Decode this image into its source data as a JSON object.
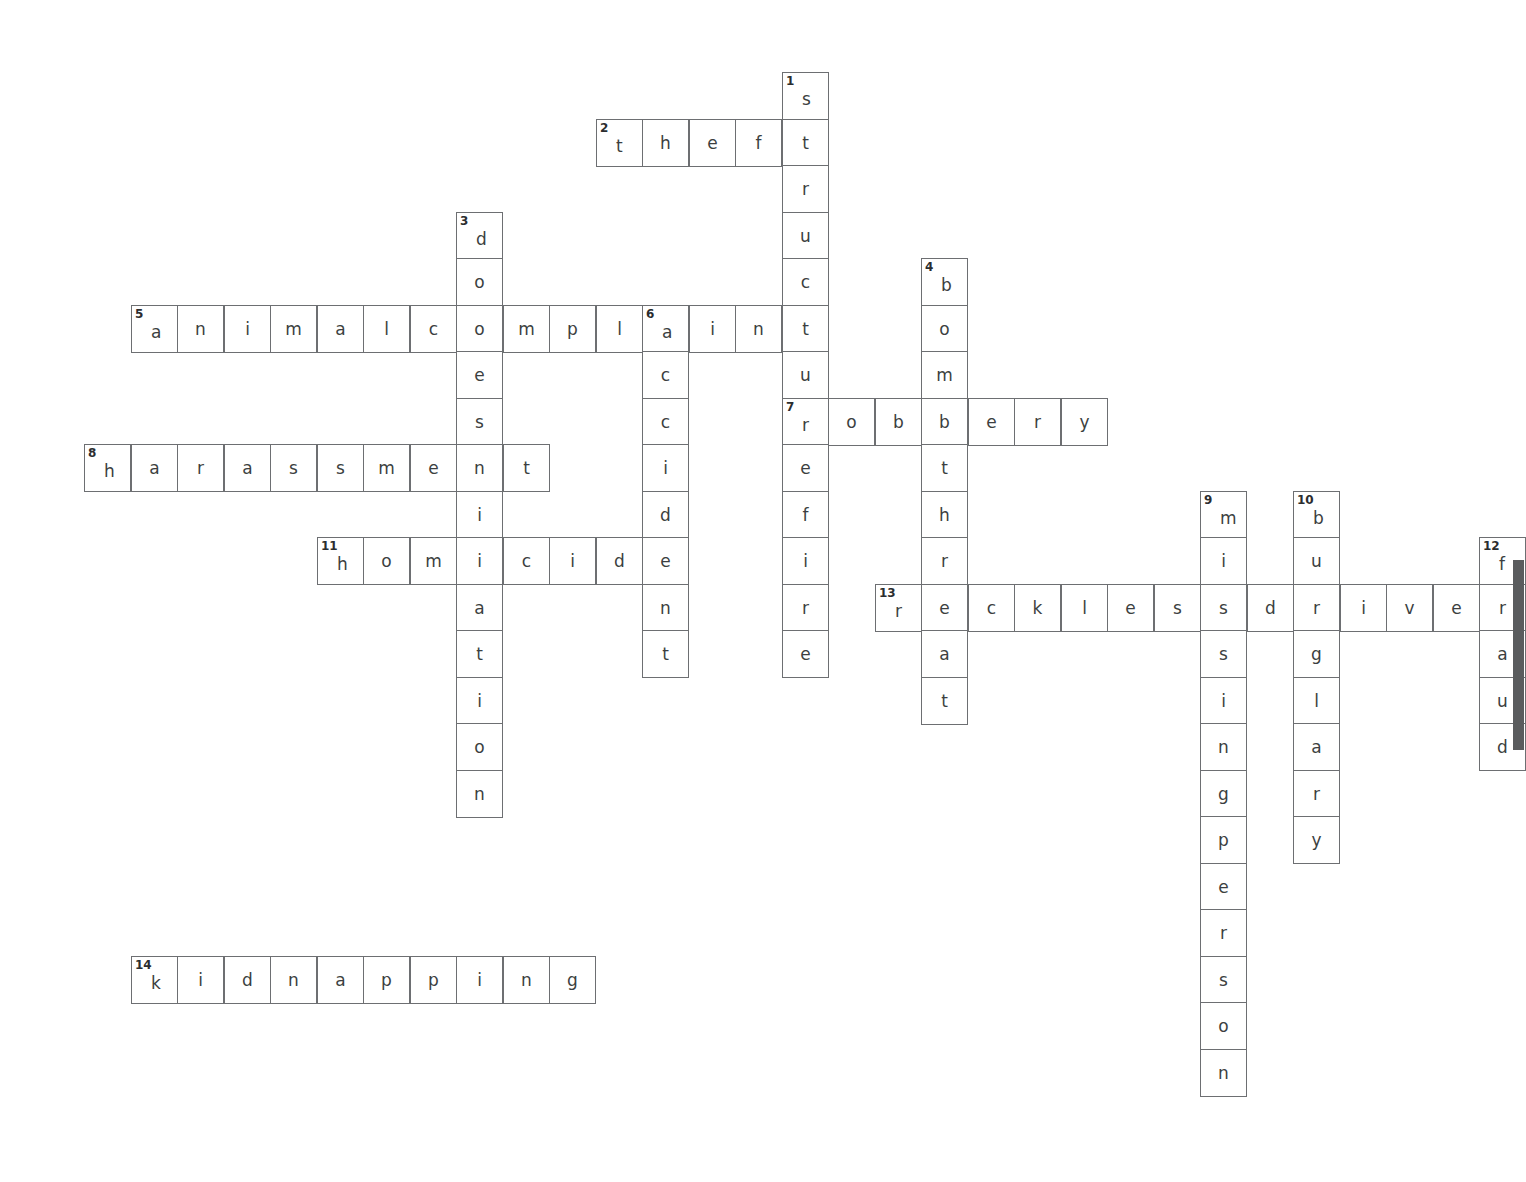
{
  "puzzle": {
    "title": "Crime Types Crossword",
    "cell_size": 46.5,
    "origin": {
      "x": 84,
      "y": 72
    },
    "grid_colors": {
      "cell_border": "#6d6f72",
      "cell_fill": "#ffffff",
      "letter": "#3c3f41",
      "number": "#2b2d2f",
      "page_background": "#ffffff",
      "scrollbar_thumb": "#5a5c5e"
    },
    "entries": [
      {
        "number": 1,
        "answer": "structurefire",
        "direction": "down",
        "row": 0,
        "col": 15,
        "length": 13
      },
      {
        "number": 2,
        "answer": "theft",
        "direction": "across",
        "row": 1,
        "col": 11,
        "length": 5
      },
      {
        "number": 3,
        "answer": "domestication",
        "direction": "down",
        "row": 3,
        "col": 8,
        "length": 13
      },
      {
        "number": 4,
        "answer": "bombthreat",
        "direction": "down",
        "row": 4,
        "col": 18,
        "length": 10
      },
      {
        "number": 5,
        "answer": "animalcomplaint",
        "direction": "across",
        "row": 5,
        "col": 1,
        "length": 15
      },
      {
        "number": 6,
        "answer": "accident",
        "direction": "down",
        "row": 5,
        "col": 12,
        "length": 8
      },
      {
        "number": 7,
        "answer": "robbery",
        "direction": "across",
        "row": 7,
        "col": 15,
        "length": 7
      },
      {
        "number": 8,
        "answer": "harassment",
        "direction": "across",
        "row": 8,
        "col": 0,
        "length": 10
      },
      {
        "number": 9,
        "answer": "missingperson",
        "direction": "down",
        "row": 9,
        "col": 24,
        "length": 13
      },
      {
        "number": 10,
        "answer": "burglary",
        "direction": "down",
        "row": 9,
        "col": 26,
        "length": 8
      },
      {
        "number": 11,
        "answer": "homicide",
        "direction": "across",
        "row": 10,
        "col": 5,
        "length": 8
      },
      {
        "number": 12,
        "answer": "fraud",
        "direction": "down",
        "row": 10,
        "col": 30,
        "length": 5
      },
      {
        "number": 13,
        "answer": "recklessdriver",
        "direction": "across",
        "row": 11,
        "col": 17,
        "length": 14
      },
      {
        "number": 14,
        "answer": "kidnapping",
        "direction": "across",
        "row": 19,
        "col": 1,
        "length": 10
      }
    ],
    "scrollbar": {
      "top": 560,
      "height": 190
    }
  }
}
